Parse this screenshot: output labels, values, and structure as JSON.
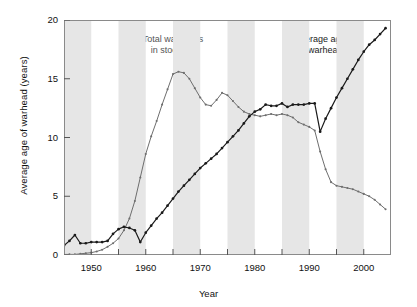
{
  "chart_data": {
    "type": "line",
    "title": "",
    "xlabel": "Year",
    "ylabel": "Average age of warhead (years)",
    "xlim": [
      1945,
      2005
    ],
    "ylim": [
      0,
      20
    ],
    "xticks": [
      1950,
      1960,
      1970,
      1980,
      1990,
      2000
    ],
    "xtick_labels": [
      "1950",
      "1960",
      "1970",
      "1980",
      "1990",
      "2000"
    ],
    "xminor_ticks": [
      1945,
      1955,
      1965,
      1975,
      1985,
      1995,
      2005
    ],
    "yticks": [
      0,
      5,
      10,
      15,
      20
    ],
    "ytick_labels": [
      "0",
      "5",
      "10",
      "15",
      "20"
    ],
    "grid": false,
    "legend_position": "inline-annotations",
    "shaded_bands": [
      [
        1945,
        1950
      ],
      [
        1955,
        1960
      ],
      [
        1965,
        1970
      ],
      [
        1975,
        1980
      ],
      [
        1985,
        1990
      ],
      [
        1995,
        2000
      ]
    ],
    "band_color": "#e6e6e6",
    "annotations": [
      {
        "text": "Total warheads in stockpile",
        "line1": "Total warheads",
        "line2": "in stockpile",
        "x": 1965,
        "y": 18.3,
        "color": "#555555"
      },
      {
        "text": "Average age of warhead",
        "line1": "Average age",
        "line2": "of warhead",
        "x": 1992,
        "y": 18.3,
        "color": "#1a1a1a"
      }
    ],
    "series": [
      {
        "name": "Total warheads in stockpile",
        "color": "#6e6e6e",
        "marker": "dot",
        "note": "plotted on same 0-20 axis as scaled stockpile index",
        "x": [
          1945,
          1946,
          1947,
          1948,
          1949,
          1950,
          1951,
          1952,
          1953,
          1954,
          1955,
          1956,
          1957,
          1958,
          1959,
          1960,
          1961,
          1962,
          1963,
          1964,
          1965,
          1966,
          1967,
          1968,
          1969,
          1970,
          1971,
          1972,
          1973,
          1974,
          1975,
          1976,
          1977,
          1978,
          1979,
          1980,
          1981,
          1982,
          1983,
          1984,
          1985,
          1986,
          1987,
          1988,
          1989,
          1990,
          1991,
          1992,
          1993,
          1994,
          1995,
          1996,
          1997,
          1998,
          1999,
          2000,
          2001,
          2002,
          2003,
          2004
        ],
        "y": [
          0.05,
          0.05,
          0.05,
          0.1,
          0.15,
          0.2,
          0.3,
          0.45,
          0.7,
          1.0,
          1.4,
          2.1,
          3.1,
          4.6,
          6.6,
          8.6,
          10.1,
          11.4,
          12.8,
          14.1,
          15.4,
          15.6,
          15.5,
          15.0,
          14.2,
          13.4,
          12.8,
          12.7,
          13.2,
          13.8,
          13.6,
          13.1,
          12.6,
          12.2,
          12.0,
          11.9,
          11.8,
          11.9,
          12.0,
          11.9,
          12.0,
          11.9,
          11.7,
          11.3,
          11.1,
          10.9,
          10.6,
          8.8,
          7.3,
          6.2,
          5.9,
          5.8,
          5.7,
          5.6,
          5.4,
          5.2,
          5.0,
          4.7,
          4.3,
          3.9
        ]
      },
      {
        "name": "Average age of warhead",
        "color": "#1a1a1a",
        "marker": "dot",
        "x": [
          1945,
          1946,
          1947,
          1948,
          1949,
          1950,
          1951,
          1952,
          1953,
          1954,
          1955,
          1956,
          1957,
          1958,
          1959,
          1960,
          1961,
          1962,
          1963,
          1964,
          1965,
          1966,
          1967,
          1968,
          1969,
          1970,
          1971,
          1972,
          1973,
          1974,
          1975,
          1976,
          1977,
          1978,
          1979,
          1980,
          1981,
          1982,
          1983,
          1984,
          1985,
          1986,
          1987,
          1988,
          1989,
          1990,
          1991,
          1992,
          1993,
          1994,
          1995,
          1996,
          1997,
          1998,
          1999,
          2000,
          2001,
          2002,
          2003,
          2004
        ],
        "y": [
          0.8,
          1.2,
          1.7,
          1.0,
          1.0,
          1.1,
          1.1,
          1.1,
          1.2,
          1.8,
          2.2,
          2.4,
          2.3,
          2.1,
          1.1,
          1.9,
          2.5,
          3.1,
          3.6,
          4.2,
          4.8,
          5.4,
          5.9,
          6.4,
          6.9,
          7.4,
          7.8,
          8.2,
          8.6,
          9.1,
          9.6,
          10.1,
          10.6,
          11.2,
          11.8,
          12.2,
          12.4,
          12.8,
          12.7,
          12.7,
          12.9,
          12.6,
          12.8,
          12.8,
          12.8,
          12.9,
          12.9,
          10.5,
          11.6,
          12.5,
          13.4,
          14.2,
          15.0,
          15.8,
          16.6,
          17.3,
          17.9,
          18.3,
          18.8,
          19.3
        ]
      }
    ]
  }
}
